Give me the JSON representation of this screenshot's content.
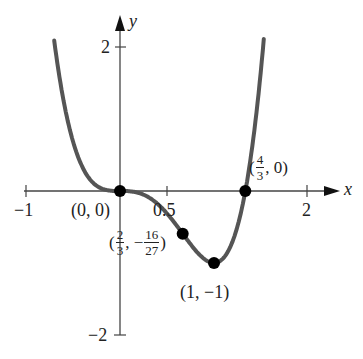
{
  "chart_data": {
    "type": "line",
    "title": "",
    "function": "f(x) = 3x^4 - 4x^3",
    "xlabel": "x",
    "ylabel": "y",
    "xlim": [
      -1,
      2.2
    ],
    "ylim": [
      -2,
      2.3
    ],
    "x_ticks": [
      -1,
      0.5,
      2
    ],
    "x_tick_labels": [
      "−1",
      "0.5",
      "2"
    ],
    "y_ticks": [
      2,
      -2
    ],
    "y_tick_labels": [
      "2",
      "−2"
    ],
    "grid": false,
    "series": [
      {
        "name": "curve",
        "x": [
          -0.7,
          -0.6,
          -0.5,
          -0.4,
          -0.3,
          -0.2,
          -0.1,
          0,
          0.1,
          0.2,
          0.3,
          0.4,
          0.5,
          0.6,
          0.667,
          0.7,
          0.8,
          0.9,
          1.0,
          1.1,
          1.2,
          1.3,
          1.333,
          1.4,
          1.5,
          1.53
        ],
        "values": [
          2.09,
          1.25,
          0.69,
          0.33,
          0.13,
          0.04,
          0.004,
          0,
          -0.004,
          -0.027,
          -0.084,
          -0.179,
          -0.313,
          -0.475,
          -0.593,
          -0.62,
          -0.819,
          -0.952,
          -1.0,
          -0.931,
          -0.691,
          -0.2,
          0,
          0.549,
          1.688,
          2.1
        ],
        "color": "#555555"
      }
    ],
    "annotations": [
      {
        "x": 0,
        "y": 0,
        "label": "(0, 0)"
      },
      {
        "x": 0.6667,
        "y": -0.5926,
        "label": "(2/3, −16/27)"
      },
      {
        "x": 1,
        "y": -1,
        "label": "(1, −1)"
      },
      {
        "x": 1.3333,
        "y": 0,
        "label": "(4/3, 0)"
      }
    ]
  },
  "labels": {
    "x_axis": "x",
    "y_axis": "y",
    "x_tick_neg1": "−1",
    "x_tick_half": "0.5",
    "x_tick_2": "2",
    "y_tick_2": "2",
    "y_tick_neg2": "−2",
    "pt_origin": "(0, 0)",
    "pt_min": "(1, −1)",
    "pt_zero_open": "(",
    "pt_zero_num": "4",
    "pt_zero_den": "3",
    "pt_zero_close": ", 0)",
    "pt_infl_open": "(",
    "pt_infl_xnum": "2",
    "pt_infl_xden": "3",
    "pt_infl_mid": ", −",
    "pt_infl_ynum": "16",
    "pt_infl_yden": "27",
    "pt_infl_close": ")"
  }
}
